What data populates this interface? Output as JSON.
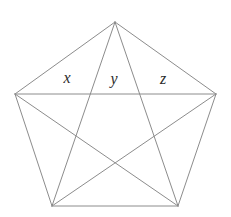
{
  "figure": {
    "type": "geometry-diagram",
    "shape": "regular-pentagon-with-all-diagonals",
    "background_color": "#ffffff",
    "line_color": "#8c8c8c",
    "label_color": "#2b2b2b",
    "vertices": [
      {
        "name": "top",
        "x": 115,
        "y": 22
      },
      {
        "name": "right",
        "x": 216,
        "y": 94
      },
      {
        "name": "bottom-right",
        "x": 178,
        "y": 206
      },
      {
        "name": "bottom-left",
        "x": 52,
        "y": 206
      },
      {
        "name": "left",
        "x": 15,
        "y": 94
      }
    ],
    "edges": [
      {
        "name": "edge-top-left",
        "from": 0,
        "to": 4
      },
      {
        "name": "edge-top-right",
        "from": 0,
        "to": 1
      },
      {
        "name": "edge-right",
        "from": 1,
        "to": 2
      },
      {
        "name": "edge-bottom",
        "from": 2,
        "to": 3
      },
      {
        "name": "edge-left",
        "from": 3,
        "to": 4
      }
    ],
    "diagonals": [
      {
        "name": "diagonal-top-to-bottom-left",
        "from": 0,
        "to": 3
      },
      {
        "name": "diagonal-top-to-bottom-right",
        "from": 0,
        "to": 2
      },
      {
        "name": "diagonal-left-to-right",
        "from": 4,
        "to": 1
      },
      {
        "name": "diagonal-left-to-bottom-right",
        "from": 4,
        "to": 2
      },
      {
        "name": "diagonal-right-to-bottom-left",
        "from": 1,
        "to": 3
      }
    ],
    "labels": [
      {
        "name": "label-x",
        "text": "x",
        "x": 67,
        "y": 78
      },
      {
        "name": "label-y",
        "text": "y",
        "x": 114,
        "y": 79
      },
      {
        "name": "label-z",
        "text": "z",
        "x": 163,
        "y": 79
      }
    ]
  }
}
